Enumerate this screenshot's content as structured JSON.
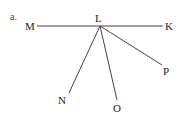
{
  "diagram": {
    "part_label": "a.",
    "vertex": {
      "name": "L",
      "x": 100,
      "y": 26
    },
    "points": [
      {
        "name": "M",
        "x": 37,
        "y": 26
      },
      {
        "name": "K",
        "x": 163,
        "y": 26
      },
      {
        "name": "N",
        "x": 69,
        "y": 93
      },
      {
        "name": "O",
        "x": 117,
        "y": 100
      },
      {
        "name": "P",
        "x": 162,
        "y": 65
      }
    ],
    "line_color": "#444444"
  }
}
